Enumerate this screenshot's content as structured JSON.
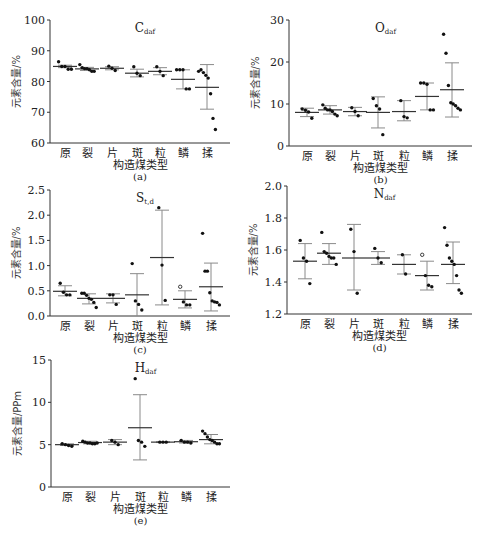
{
  "figure": {
    "categories": [
      "原",
      "裂",
      "片",
      "斑",
      "粒",
      "鳞",
      "揉"
    ],
    "xlabel": "构造煤类型"
  },
  "chart_data": [
    {
      "id": "a",
      "type": "scatter",
      "caption": "(a)",
      "title": "C",
      "title_sub": "daf",
      "xlabel": "构造煤类型",
      "ylabel": "元素含量/%",
      "ylim": [
        60,
        100
      ],
      "yticks": [
        60,
        70,
        80,
        90,
        100
      ],
      "box": {
        "left": 50,
        "right": 230,
        "top": 20,
        "bottom": 143
      },
      "categories": [
        "原",
        "裂",
        "片",
        "斑",
        "粒",
        "鳞",
        "揉"
      ],
      "cx": [
        65,
        87,
        112,
        137,
        160,
        183,
        207
      ],
      "mean": [
        84.9,
        84.1,
        84.3,
        82.7,
        83.3,
        80.7,
        78.1
      ],
      "err_hi": [
        85.3,
        84.6,
        84.8,
        84.0,
        84.5,
        83.8,
        85.5
      ],
      "err_lo": [
        84.5,
        83.6,
        83.8,
        81.5,
        82.2,
        77.6,
        71.0
      ],
      "points": [
        [
          86.4,
          84.9,
          84.9,
          84.0,
          84.0
        ],
        [
          85.5,
          84.5,
          84.2,
          84.2,
          83.8,
          83.3,
          83.3
        ],
        [
          85.0,
          84.3,
          83.6
        ],
        [
          84.8,
          82.7,
          81.9
        ],
        [
          84.8,
          83.3,
          81.9
        ],
        [
          83.8,
          83.8,
          83.8,
          77.6,
          77.6
        ],
        [
          83.3,
          83.8,
          82.9,
          82.0,
          81.1,
          76.0,
          68.0,
          64.4
        ]
      ]
    },
    {
      "id": "b",
      "type": "scatter",
      "caption": "(b)",
      "title": "O",
      "title_sub": "daf",
      "xlabel": "构造煤类型",
      "ylabel": "元素含量/%",
      "ylim": [
        0,
        30
      ],
      "yticks": [
        0,
        10,
        20,
        30
      ],
      "box": {
        "left": 289,
        "right": 472,
        "top": 20,
        "bottom": 146
      },
      "categories": [
        "原",
        "裂",
        "片",
        "斑",
        "粒",
        "鳞",
        "揉"
      ],
      "cx": [
        307,
        330,
        355,
        378,
        404,
        427,
        452
      ],
      "mean": [
        8.0,
        8.6,
        8.2,
        8.0,
        8.2,
        11.8,
        13.4
      ],
      "err_hi": [
        9.0,
        9.6,
        9.2,
        11.7,
        10.8,
        15.0,
        19.8
      ],
      "err_lo": [
        7.0,
        7.6,
        7.2,
        4.3,
        6.0,
        8.6,
        6.9
      ],
      "points": [
        [
          8.8,
          8.5,
          8.1,
          6.6
        ],
        [
          9.8,
          9.0,
          8.6,
          8.6,
          8.2,
          7.6,
          7.2
        ],
        [
          9.1,
          8.2,
          7.2
        ],
        [
          11.3,
          9.6,
          8.8,
          2.7
        ],
        [
          10.8,
          7.0,
          6.7
        ],
        [
          15.0,
          15.0,
          14.7,
          8.6,
          8.6
        ],
        [
          26.6,
          22.1,
          14.4,
          10.3,
          10.0,
          9.6,
          9.0,
          8.6
        ]
      ]
    },
    {
      "id": "c",
      "type": "scatter",
      "caption": "(c)",
      "title": "S",
      "title_sub": "t,d",
      "xlabel": "构造煤类型",
      "ylabel": "元素含量/%",
      "ylim": [
        0,
        2.5
      ],
      "yticks": [
        0.0,
        0.5,
        1.0,
        1.5,
        2.0,
        2.5
      ],
      "box": {
        "left": 50,
        "right": 230,
        "top": 190,
        "bottom": 316
      },
      "categories": [
        "原",
        "裂",
        "片",
        "斑",
        "粒",
        "鳞",
        "揉"
      ],
      "cx": [
        65,
        89,
        113,
        137,
        162,
        185,
        211
      ],
      "mean": [
        0.49,
        0.35,
        0.35,
        0.42,
        1.16,
        0.33,
        0.58
      ],
      "err_hi": [
        0.6,
        0.44,
        0.44,
        0.84,
        2.1,
        0.5,
        1.05
      ],
      "err_lo": [
        0.4,
        0.24,
        0.26,
        0.0,
        0.22,
        0.16,
        0.1
      ],
      "points": [
        [
          0.65,
          0.47,
          0.42,
          0.42
        ],
        [
          0.45,
          0.45,
          0.41,
          0.35,
          0.33,
          0.27,
          0.17
        ],
        [
          0.42,
          0.42,
          0.23
        ],
        [
          1.04,
          0.3,
          0.23,
          0.12
        ],
        [
          2.15,
          1.01,
          0.31
        ],
        [
          0.58,
          0.28,
          0.22,
          0.22
        ],
        [
          1.64,
          0.89,
          0.89,
          0.46,
          0.3,
          0.28,
          0.27,
          0.22
        ]
      ]
    },
    {
      "id": "d",
      "type": "scatter",
      "caption": "(d)",
      "title": "N",
      "title_sub": "daf",
      "xlabel": "构造煤类型",
      "ylabel": "元素含量/%",
      "ylim": [
        1.2,
        2.0
      ],
      "yticks": [
        1.2,
        1.4,
        1.6,
        1.8,
        2.0
      ],
      "box": {
        "left": 287,
        "right": 472,
        "top": 186,
        "bottom": 314
      },
      "categories": [
        "原",
        "裂",
        "片",
        "斑",
        "粒",
        "鳞",
        "揉"
      ],
      "cx": [
        305,
        329,
        354,
        378,
        404,
        427,
        453
      ],
      "mean": [
        1.53,
        1.58,
        1.55,
        1.55,
        1.51,
        1.44,
        1.51
      ],
      "err_hi": [
        1.64,
        1.64,
        1.76,
        1.59,
        1.57,
        1.53,
        1.65
      ],
      "err_lo": [
        1.42,
        1.51,
        1.35,
        1.51,
        1.45,
        1.35,
        1.39
      ],
      "points": [
        [
          1.66,
          1.55,
          1.53,
          1.39
        ],
        [
          1.71,
          1.59,
          1.58,
          1.56,
          1.55,
          1.55,
          1.51
        ],
        [
          1.73,
          1.59,
          1.33
        ],
        [
          1.61,
          1.55,
          1.52
        ],
        [
          1.57,
          1.45
        ],
        [
          1.57,
          1.44,
          1.38,
          1.37
        ],
        [
          1.74,
          1.63,
          1.55,
          1.53,
          1.51,
          1.44,
          1.35,
          1.33
        ]
      ]
    },
    {
      "id": "e",
      "type": "scatter",
      "caption": "(e)",
      "title": "H",
      "title_sub": "daf",
      "xlabel": "构造煤类型",
      "ylabel": "元素含量/PPm",
      "ylim": [
        0,
        15
      ],
      "yticks": [
        0,
        5,
        10,
        15
      ],
      "box": {
        "left": 51,
        "right": 230,
        "top": 360,
        "bottom": 487
      },
      "categories": [
        "原",
        "裂",
        "片",
        "斑",
        "粒",
        "鳞",
        "揉"
      ],
      "cx": [
        67,
        90,
        115,
        140,
        163,
        186,
        211
      ],
      "mean": [
        5.0,
        5.25,
        5.3,
        7.0,
        5.3,
        5.35,
        5.6
      ],
      "err_hi": [
        5.1,
        5.4,
        5.6,
        10.9,
        5.35,
        5.5,
        6.2
      ],
      "err_lo": [
        4.9,
        5.1,
        5.0,
        3.2,
        5.25,
        5.2,
        5.1
      ],
      "points": [
        [
          5.1,
          5.0,
          4.9,
          4.8
        ],
        [
          5.4,
          5.3,
          5.2,
          5.2,
          5.1,
          5.1,
          5.2
        ],
        [
          5.5,
          5.3,
          5.0
        ],
        [
          12.8,
          5.5,
          5.3,
          4.8
        ],
        [
          5.3,
          5.3,
          5.3
        ],
        [
          5.5,
          5.3,
          5.3,
          5.2
        ],
        [
          6.6,
          6.3,
          5.9,
          5.6,
          5.5,
          5.3,
          5.1,
          5.1
        ]
      ]
    }
  ]
}
